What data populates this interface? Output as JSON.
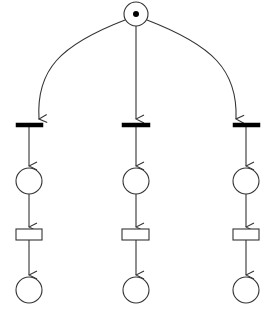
{
  "diagram": {
    "type": "petri-net",
    "stroke_color": "#333333",
    "fill_color": "#ffffff",
    "token_color": "#000000",
    "places": [
      {
        "id": "p0",
        "cx": 136,
        "cy": 14,
        "r": 12,
        "tokens": 1
      },
      {
        "id": "p1a",
        "cx": 29,
        "cy": 181,
        "r": 13,
        "tokens": 0
      },
      {
        "id": "p1b",
        "cx": 136,
        "cy": 181,
        "r": 13,
        "tokens": 0
      },
      {
        "id": "p1c",
        "cx": 246,
        "cy": 181,
        "r": 13,
        "tokens": 0
      },
      {
        "id": "p2a",
        "cx": 29,
        "cy": 290,
        "r": 13,
        "tokens": 0
      },
      {
        "id": "p2b",
        "cx": 136,
        "cy": 290,
        "r": 13,
        "tokens": 0
      },
      {
        "id": "p2c",
        "cx": 246,
        "cy": 290,
        "r": 13,
        "tokens": 0
      }
    ],
    "transitions": [
      {
        "id": "t1a",
        "kind": "immediate",
        "x": 16,
        "y": 123,
        "w": 27,
        "h": 4
      },
      {
        "id": "t1b",
        "kind": "immediate",
        "x": 122,
        "y": 123,
        "w": 28,
        "h": 4
      },
      {
        "id": "t1c",
        "kind": "immediate",
        "x": 233,
        "y": 123,
        "w": 27,
        "h": 4
      },
      {
        "id": "t2a",
        "kind": "timed",
        "x": 16,
        "y": 229,
        "w": 26,
        "h": 11
      },
      {
        "id": "t2b",
        "kind": "timed",
        "x": 122,
        "y": 229,
        "w": 27,
        "h": 11
      },
      {
        "id": "t2c",
        "kind": "timed",
        "x": 233,
        "y": 229,
        "w": 26,
        "h": 11
      }
    ],
    "arcs": [
      {
        "from": "p0",
        "to": "t1a",
        "path": "M 125 20 C 60 45, 36 70, 39 119"
      },
      {
        "from": "p0",
        "to": "t1b",
        "path": "M 136 26 L 136 119"
      },
      {
        "from": "p0",
        "to": "t1c",
        "path": "M 147 20 C 212 45, 238 70, 236 119"
      },
      {
        "from": "t1a",
        "to": "p1a",
        "path": "M 29 127 L 29 166"
      },
      {
        "from": "t1b",
        "to": "p1b",
        "path": "M 136 127 L 136 166"
      },
      {
        "from": "t1c",
        "to": "p1c",
        "path": "M 246 127 L 246 166"
      },
      {
        "from": "p1a",
        "to": "t2a",
        "path": "M 29 194 L 29 227"
      },
      {
        "from": "p1b",
        "to": "t2b",
        "path": "M 136 194 L 136 227"
      },
      {
        "from": "p1c",
        "to": "t2c",
        "path": "M 246 194 L 246 227"
      },
      {
        "from": "t2a",
        "to": "p2a",
        "path": "M 29 240 L 29 275"
      },
      {
        "from": "t2b",
        "to": "p2b",
        "path": "M 136 240 L 136 275"
      },
      {
        "from": "t2c",
        "to": "p2c",
        "path": "M 246 240 L 246 275"
      }
    ]
  }
}
